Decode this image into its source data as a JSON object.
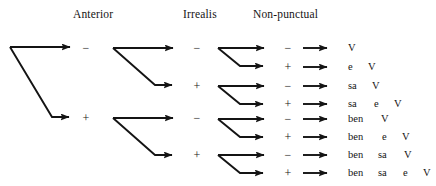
{
  "diagram": {
    "type": "binary-feature-tree",
    "headers": [
      {
        "label": "Anterior",
        "x": 73,
        "y": 8
      },
      {
        "label": "Irrealis",
        "x": 183,
        "y": 8
      },
      {
        "label": "Non-punctual",
        "x": 253,
        "y": 8
      }
    ],
    "level1": [
      {
        "label": "−",
        "x": 85,
        "y": 48
      },
      {
        "label": "+",
        "x": 85,
        "y": 118
      }
    ],
    "level2": [
      {
        "label": "−",
        "x": 196,
        "y": 48
      },
      {
        "label": "+",
        "x": 196,
        "y": 86
      },
      {
        "label": "−",
        "x": 196,
        "y": 118
      },
      {
        "label": "+",
        "x": 196,
        "y": 155
      }
    ],
    "level3": [
      {
        "label": "−",
        "x": 287,
        "y": 48
      },
      {
        "label": "+",
        "x": 287,
        "y": 67
      },
      {
        "label": "−",
        "x": 287,
        "y": 86
      },
      {
        "label": "+",
        "x": 287,
        "y": 104
      },
      {
        "label": "−",
        "x": 287,
        "y": 119
      },
      {
        "label": "+",
        "x": 287,
        "y": 137
      },
      {
        "label": "−",
        "x": 287,
        "y": 155
      },
      {
        "label": "+",
        "x": 287,
        "y": 173
      }
    ],
    "outputs": [
      {
        "y": 48,
        "cells": [
          {
            "t": "V",
            "x": 348
          }
        ]
      },
      {
        "y": 67,
        "cells": [
          {
            "t": "e",
            "x": 348
          },
          {
            "t": "V",
            "x": 368
          }
        ]
      },
      {
        "y": 86,
        "cells": [
          {
            "t": "sa",
            "x": 348
          },
          {
            "t": "V",
            "x": 372
          }
        ]
      },
      {
        "y": 104,
        "cells": [
          {
            "t": "sa",
            "x": 348
          },
          {
            "t": "e",
            "x": 374
          },
          {
            "t": "V",
            "x": 394
          }
        ]
      },
      {
        "y": 119,
        "cells": [
          {
            "t": "ben",
            "x": 348
          },
          {
            "t": "V",
            "x": 381
          }
        ]
      },
      {
        "y": 137,
        "cells": [
          {
            "t": "ben",
            "x": 348
          },
          {
            "t": "e",
            "x": 382
          },
          {
            "t": "V",
            "x": 402
          }
        ]
      },
      {
        "y": 155,
        "cells": [
          {
            "t": "ben",
            "x": 348
          },
          {
            "t": "sa",
            "x": 378
          },
          {
            "t": "V",
            "x": 404
          }
        ]
      },
      {
        "y": 173,
        "cells": [
          {
            "t": "ben",
            "x": 348
          },
          {
            "t": "sa",
            "x": 378
          },
          {
            "t": "e",
            "x": 403
          },
          {
            "t": "V",
            "x": 423
          }
        ]
      }
    ],
    "colors": {
      "ink": "#1a1a1a",
      "background": "#ffffff"
    },
    "branches": {
      "root": {
        "x": 10,
        "y_top": 47,
        "y_bottom": 117,
        "x_fork": 52,
        "x_arrow": 77
      },
      "level2_forks": [
        {
          "x": 113,
          "y_top": 48,
          "y_bottom": 85,
          "x_fork": 155,
          "x_arrow": 180
        },
        {
          "x": 113,
          "y_top": 118,
          "y_bottom": 155,
          "x_fork": 155,
          "x_arrow": 180
        }
      ],
      "level3_forks": [
        {
          "x": 218,
          "y_top": 48,
          "y_bottom": 67,
          "x_fork": 240,
          "x_arrow": 271
        },
        {
          "x": 218,
          "y_top": 86,
          "y_bottom": 104,
          "x_fork": 240,
          "x_arrow": 271
        },
        {
          "x": 218,
          "y_top": 119,
          "y_bottom": 137,
          "x_fork": 240,
          "x_arrow": 271
        },
        {
          "x": 218,
          "y_top": 155,
          "y_bottom": 173,
          "x_fork": 240,
          "x_arrow": 271
        }
      ],
      "terminal_arrows": {
        "x_start": 303,
        "x_end": 334
      }
    }
  }
}
